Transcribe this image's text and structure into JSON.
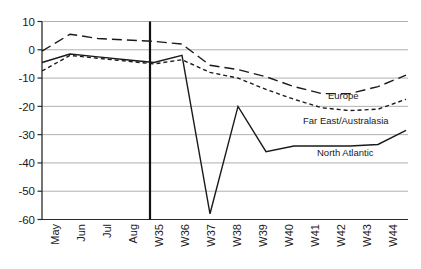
{
  "chart_data": {
    "type": "line",
    "title": "",
    "categories": [
      "May",
      "Jun",
      "Jul",
      "Aug",
      "W35",
      "W36",
      "W37",
      "W38",
      "W39",
      "W40",
      "W41",
      "W42",
      "W43",
      "W44"
    ],
    "series": [
      {
        "name": "Europe",
        "line_style": "long-dash",
        "values": [
          -0.5,
          5.5,
          4,
          3.5,
          3,
          2,
          -5.5,
          -7,
          -9.5,
          -13,
          -15.5,
          -15.5,
          -13,
          -9
        ],
        "label": {
          "text": "Europe",
          "x": 328,
          "y": 99
        }
      },
      {
        "name": "Far East/Australasia",
        "line_style": "short-dash",
        "values": [
          -7.5,
          -2,
          -3,
          -4,
          -5,
          -3.5,
          -8,
          -10,
          -14,
          -17.5,
          -20.5,
          -21.5,
          -21,
          -17.5
        ],
        "label": {
          "text": "Far East/Australasia",
          "x": 303,
          "y": 124
        }
      },
      {
        "name": "North Atlantic",
        "line_style": "solid",
        "values": [
          -4.5,
          -1.5,
          -2.5,
          -3.5,
          -4.5,
          -2,
          -58,
          -20,
          -36,
          -34,
          -34,
          -34,
          -33.5,
          -28.5
        ],
        "label": {
          "text": "North Atlantic",
          "x": 317,
          "y": 156
        }
      }
    ],
    "ylim": [
      -60,
      10
    ],
    "yticks": [
      10,
      0,
      -10,
      -20,
      -30,
      -40,
      -50,
      -60
    ],
    "grid": true,
    "legend": "inline-labels",
    "divider_between_categories": [
      "Aug",
      "W35"
    ],
    "colors": {
      "line": "#1a1a1a",
      "grid": "#b0b0b0",
      "axis": "#2a2a2a",
      "divider": "#111111",
      "text": "#1a1a1a",
      "background": "#ffffff"
    }
  }
}
